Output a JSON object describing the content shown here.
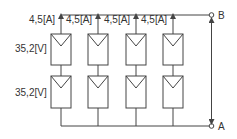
{
  "diagram": {
    "colors": {
      "line": "#444444",
      "panel_fill": "#ffffff",
      "text": "#333333"
    },
    "strings": [
      {
        "current_label": "4,5[A]",
        "x": 61
      },
      {
        "current_label": "4,5[A]",
        "x": 98
      },
      {
        "current_label": "4,5[A]",
        "x": 136
      },
      {
        "current_label": "4,5[A]",
        "x": 173
      }
    ],
    "voltage_labels": [
      "35,2[V]",
      "35,2[V]"
    ],
    "terminals": {
      "top": "B",
      "bottom": "A"
    }
  }
}
